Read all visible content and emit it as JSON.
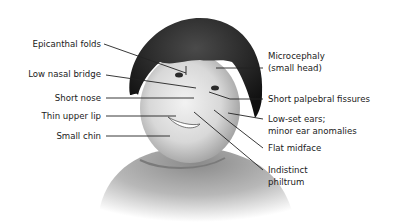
{
  "left_labels": [
    {
      "id": "epicanthal-folds",
      "text": "Epicanthal folds"
    },
    {
      "id": "low-nasal-bridge",
      "text": "Low nasal bridge"
    },
    {
      "id": "short-nose",
      "text": "Short nose"
    },
    {
      "id": "thin-upper-lip",
      "text": "Thin upper lip"
    },
    {
      "id": "small-chin",
      "text": "Small chin"
    }
  ],
  "right_labels": [
    {
      "id": "microcephaly",
      "line1": "Microcephaly",
      "line2": "(small head)"
    },
    {
      "id": "short-palpebral-fissures",
      "line1": "Short palpebral fissures"
    },
    {
      "id": "low-set-ears",
      "line1": "Low-set ears;",
      "line2": "minor ear anomalies"
    },
    {
      "id": "flat-midface",
      "line1": "Flat midface"
    },
    {
      "id": "indistinct-philtrum",
      "line1": "Indistinct",
      "line2": "philtrum"
    }
  ],
  "colors": {
    "leader_line": "#222222",
    "hair": "#1c1c1c",
    "skin": "#d9d9d9",
    "shirt": "#9a9a9a",
    "text": "#1a1a1a"
  }
}
